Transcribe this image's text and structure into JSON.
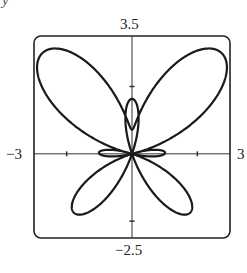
{
  "corner_glyph": "y",
  "chart_data": {
    "type": "line",
    "subtype": "polar",
    "title": "",
    "equation": "r = e^(sin θ) − 2cos(4θ)",
    "theta_range": [
      0,
      6.283185307
    ],
    "xlabel": "",
    "ylabel": "",
    "xlim": [
      -3,
      3
    ],
    "ylim": [
      -2.5,
      3.5
    ],
    "x_tick_labels": {
      "left": "−3",
      "right": "3"
    },
    "y_tick_labels": {
      "top": "3.5",
      "bottom": "−2.5"
    },
    "x_ticks": [
      -2,
      2
    ],
    "y_ticks": [
      -2,
      2
    ],
    "grid": false,
    "legend": null,
    "line_color": "#1a1a1a"
  }
}
